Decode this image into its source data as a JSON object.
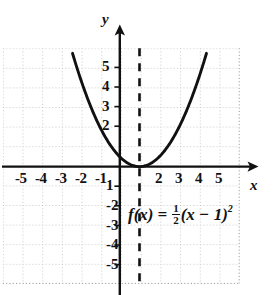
{
  "figure": {
    "kind": "cartesian-plane-parabola",
    "background_color": "#ffffff",
    "ink_color": "#111111",
    "grid_color": "#9a9a9a"
  },
  "axes": {
    "x_axis_label": "x",
    "y_axis_label": "y",
    "x_tick_labels": [
      "-5",
      "-4",
      "-3",
      "-2",
      "-1",
      "2",
      "3",
      "4",
      "5"
    ],
    "y_tick_labels_positive": [
      "5",
      "4",
      "3",
      "2"
    ],
    "y_tick_labels_negative": [
      "1",
      "2",
      "3",
      "4",
      "5"
    ],
    "y_negative_display": [
      "-1",
      "-2",
      "-3",
      "-4",
      "-5"
    ],
    "xlim": [
      -6,
      6
    ],
    "ylim": [
      -6,
      6
    ],
    "grid": "dotted"
  },
  "equation": {
    "function_name": "f(x)",
    "equals": "=",
    "fraction_numerator": "1",
    "fraction_denominator": "2",
    "body": "(x − 1)",
    "exponent": "2",
    "plain": "f(x) = 1/2(x - 1)^2"
  },
  "annotations": {
    "axis_of_symmetry": {
      "style": "dashed",
      "x_value": 1,
      "label": ""
    },
    "vertex": {
      "x": 1,
      "y": 0
    }
  },
  "chart_data": {
    "type": "line",
    "title": "",
    "xlabel": "x",
    "ylabel": "y",
    "xlim": [
      -6,
      6
    ],
    "ylim": [
      -6,
      6
    ],
    "grid": true,
    "legend": "none",
    "series": [
      {
        "name": "f(x) = 1/2(x - 1)^2",
        "x": [
          -2.4,
          -2.0,
          -1.5,
          -1.0,
          -0.5,
          0.0,
          0.5,
          1.0,
          1.5,
          2.0,
          2.5,
          3.0,
          3.5,
          4.0,
          4.4
        ],
        "values": [
          5.78,
          4.5,
          3.125,
          2.0,
          1.125,
          0.5,
          0.125,
          0.0,
          0.125,
          0.5,
          1.125,
          2.0,
          3.125,
          4.5,
          5.78
        ]
      }
    ],
    "annotations": [
      {
        "type": "vline",
        "x": 1,
        "style": "dashed",
        "label": "axis of symmetry"
      },
      {
        "type": "point",
        "x": 1,
        "y": 0,
        "label": "vertex"
      }
    ]
  }
}
